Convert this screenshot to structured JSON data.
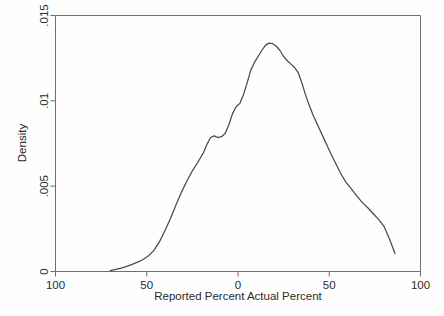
{
  "chart": {
    "background_color": "#fefefe",
    "line_color": "#4a4a4a",
    "axis_color": "#6e6e6e",
    "text_color": "#2b2b2b"
  },
  "chart_data": {
    "type": "line",
    "title": "",
    "subtitle": "",
    "xlabel": "Reported Percent  Actual Percent",
    "ylabel": "Density",
    "xlim": [
      -100,
      100
    ],
    "ylim": [
      0,
      0.015
    ],
    "grid": false,
    "legend": false,
    "xticks": [
      -100,
      -50,
      0,
      50,
      100
    ],
    "xtick_labels": [
      "100",
      "50",
      "0",
      "50",
      "100"
    ],
    "yticks": [
      0,
      0.005,
      0.01,
      0.015
    ],
    "ytick_labels": [
      "0",
      ".005",
      ".01",
      ".015"
    ],
    "series": [
      {
        "name": "Kernel density",
        "x": [
          -70,
          -67,
          -64,
          -61,
          -58,
          -55,
          -52,
          -49,
          -46,
          -43,
          -40,
          -37,
          -34,
          -31,
          -28,
          -25,
          -22,
          -19,
          -17,
          -15,
          -13,
          -11,
          -9,
          -7,
          -5,
          -3,
          -1,
          1,
          3,
          5,
          7,
          9,
          11,
          13,
          15,
          17,
          19,
          21,
          23,
          25,
          27,
          29,
          31,
          33,
          35,
          37,
          39,
          41,
          44,
          47,
          50,
          53,
          56,
          59,
          62,
          65,
          68,
          71,
          74,
          77,
          80,
          83,
          86
        ],
        "y": [
          5e-05,
          0.00012,
          0.0002,
          0.0003,
          0.00042,
          0.00055,
          0.0007,
          0.00092,
          0.00125,
          0.00175,
          0.0024,
          0.0031,
          0.0039,
          0.00465,
          0.0053,
          0.0059,
          0.0064,
          0.00695,
          0.00745,
          0.00785,
          0.00795,
          0.00785,
          0.0079,
          0.0081,
          0.0086,
          0.00925,
          0.00965,
          0.00985,
          0.01035,
          0.01105,
          0.0118,
          0.01225,
          0.0126,
          0.01295,
          0.01325,
          0.01338,
          0.01335,
          0.0132,
          0.01295,
          0.0126,
          0.01235,
          0.01215,
          0.01195,
          0.01165,
          0.01105,
          0.01035,
          0.00975,
          0.0092,
          0.0085,
          0.0078,
          0.0071,
          0.00645,
          0.0058,
          0.00525,
          0.00485,
          0.00445,
          0.00405,
          0.00375,
          0.0034,
          0.00305,
          0.00265,
          0.0019,
          0.00105
        ]
      }
    ]
  }
}
